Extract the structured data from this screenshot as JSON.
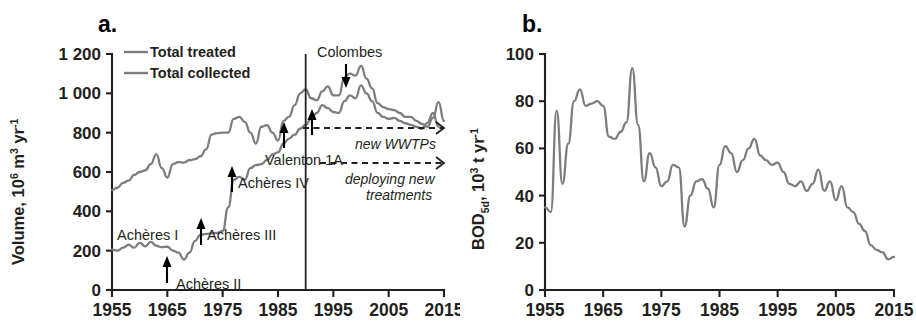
{
  "figure": {
    "background": "#ffffff",
    "line_color": "#7d7d7d",
    "axis_color": "#231f20"
  },
  "panels": {
    "a": {
      "letter": "a.",
      "ylabel_main": "Volume, 10",
      "ylabel_sup1": "6",
      "ylabel_mid": " m",
      "ylabel_sup2": "3",
      "ylabel_tail": " yr",
      "ylabel_sup3": "-1",
      "legend": [
        {
          "label": "Total treated",
          "color": "#7d7d7d"
        },
        {
          "label": "Total collected",
          "color": "#7d7d7d"
        }
      ],
      "annotations": [
        {
          "name": "acheres-1",
          "text": "Achères I"
        },
        {
          "name": "acheres-2",
          "text": "Achères II"
        },
        {
          "name": "acheres-3",
          "text": "Achères III"
        },
        {
          "name": "acheres-4",
          "text": "Achères IV"
        },
        {
          "name": "valenton-1a",
          "text": "Valenton  1A"
        },
        {
          "name": "colombes",
          "text": "Colombes"
        }
      ],
      "italic_notes": [
        {
          "name": "new-wwtps",
          "text": "new WWTPs"
        },
        {
          "name": "deploying-line1",
          "text": "deploying new"
        },
        {
          "name": "deploying-line2",
          "text": "treatments"
        }
      ]
    },
    "b": {
      "letter": "b.",
      "ylabel_main": "BOD",
      "ylabel_sub": "5d",
      "ylabel_mid": ", 10",
      "ylabel_sup1": "3",
      "ylabel_tail": " t yr",
      "ylabel_sup2": "-1"
    }
  },
  "chart_data": [
    {
      "id": "panel-a",
      "type": "line",
      "title": "a.",
      "xlabel": "",
      "ylabel": "Volume, 10^6 m^3 yr^-1",
      "xlim": [
        1955,
        2015
      ],
      "ylim": [
        0,
        1200
      ],
      "xticks": [
        1955,
        1965,
        1975,
        1985,
        1995,
        2005,
        2015
      ],
      "yticks": [
        0,
        200,
        400,
        600,
        800,
        1000,
        1200
      ],
      "grid": false,
      "legend_position": "top-left",
      "vertical_marker": {
        "x": 1990,
        "label": ""
      },
      "series": [
        {
          "name": "Total collected",
          "color": "#7d7d7d",
          "x": [
            1955,
            1956,
            1957,
            1958,
            1959,
            1960,
            1961,
            1962,
            1963,
            1964,
            1965,
            1966,
            1967,
            1968,
            1969,
            1970,
            1971,
            1972,
            1973,
            1974,
            1975,
            1976,
            1977,
            1978,
            1979,
            1980,
            1981,
            1982,
            1983,
            1984,
            1985,
            1986,
            1987,
            1988,
            1989,
            1990,
            1991,
            1992,
            1993,
            1994,
            1995,
            1996,
            1997,
            1998,
            1999,
            2000,
            2001,
            2002,
            2003,
            2004,
            2005,
            2006,
            2007,
            2008,
            2009,
            2010,
            2011,
            2012,
            2013,
            2014,
            2015
          ],
          "values": [
            508,
            520,
            545,
            556,
            585,
            600,
            608,
            640,
            690,
            620,
            572,
            640,
            650,
            648,
            660,
            665,
            680,
            715,
            790,
            798,
            800,
            800,
            870,
            880,
            855,
            800,
            745,
            830,
            838,
            800,
            760,
            860,
            880,
            940,
            1000,
            1020,
            975,
            965,
            1010,
            1035,
            990,
            990,
            1080,
            1100,
            1090,
            1140,
            1075,
            1025,
            950,
            930,
            920,
            915,
            900,
            880,
            880,
            860,
            845,
            830,
            875,
            955,
            860
          ]
        },
        {
          "name": "Total treated",
          "color": "#7d7d7d",
          "x": [
            1955,
            1956,
            1957,
            1958,
            1959,
            1960,
            1961,
            1962,
            1963,
            1964,
            1965,
            1966,
            1967,
            1968,
            1969,
            1970,
            1971,
            1972,
            1973,
            1974,
            1975,
            1976,
            1977,
            1978,
            1979,
            1980,
            1981,
            1982,
            1983,
            1984,
            1985,
            1986,
            1987,
            1988,
            1989,
            1990,
            1991,
            1992,
            1993,
            1994,
            1995,
            1996,
            1997,
            1998,
            1999,
            2000,
            2001,
            2002,
            2003,
            2004,
            2005,
            2006,
            2007,
            2008,
            2009,
            2010,
            2011,
            2012,
            2013,
            2014,
            2015
          ],
          "values": [
            205,
            200,
            215,
            230,
            215,
            240,
            222,
            245,
            225,
            218,
            220,
            200,
            190,
            155,
            190,
            250,
            280,
            285,
            288,
            290,
            300,
            420,
            560,
            575,
            560,
            620,
            635,
            640,
            660,
            690,
            700,
            745,
            770,
            790,
            820,
            840,
            870,
            900,
            940,
            925,
            905,
            900,
            960,
            990,
            975,
            1040,
            1000,
            960,
            900,
            880,
            870,
            875,
            860,
            848,
            840,
            830,
            820,
            850,
            900,
            830
          ]
        }
      ],
      "event_markers": [
        {
          "label": "Achères I",
          "x": 1958
        },
        {
          "label": "Achères II",
          "x": 1967
        },
        {
          "label": "Achères III",
          "x": 1972
        },
        {
          "label": "Achères IV",
          "x": 1978
        },
        {
          "label": "Valenton  1A",
          "x": 1987
        },
        {
          "label": "Colombes",
          "x": 1997
        }
      ],
      "trend_arrows": [
        {
          "label": "new WWTPs",
          "y": 805,
          "x_start": 1990,
          "x_end": 2015
        },
        {
          "label": "deploying new treatments",
          "y": 630,
          "x_start": 1990,
          "x_end": 2015
        }
      ]
    },
    {
      "id": "panel-b",
      "type": "line",
      "title": "b.",
      "xlabel": "",
      "ylabel": "BOD_5d, 10^3 t yr^-1",
      "xlim": [
        1955,
        2015
      ],
      "ylim": [
        0,
        100
      ],
      "xticks": [
        1955,
        1965,
        1975,
        1985,
        1995,
        2005,
        2015
      ],
      "yticks": [
        0,
        20,
        40,
        60,
        80,
        100
      ],
      "grid": false,
      "legend_position": "none",
      "series": [
        {
          "name": "BOD5d load",
          "color": "#7d7d7d",
          "x": [
            1955,
            1956,
            1957,
            1958,
            1959,
            1960,
            1961,
            1962,
            1963,
            1964,
            1965,
            1966,
            1967,
            1968,
            1969,
            1970,
            1971,
            1972,
            1973,
            1974,
            1975,
            1976,
            1977,
            1978,
            1979,
            1980,
            1981,
            1982,
            1983,
            1984,
            1985,
            1986,
            1987,
            1988,
            1989,
            1990,
            1991,
            1992,
            1993,
            1994,
            1995,
            1996,
            1997,
            1998,
            1999,
            2000,
            2001,
            2002,
            2003,
            2004,
            2005,
            2006,
            2007,
            2008,
            2009,
            2010,
            2011,
            2012,
            2013,
            2014,
            2015
          ],
          "values": [
            35,
            33,
            76,
            45,
            62,
            80,
            85,
            78,
            79,
            80,
            78,
            65,
            64,
            67,
            71,
            94,
            70,
            46,
            58,
            52,
            44,
            46,
            53,
            52,
            27,
            40,
            46,
            47,
            43,
            35,
            53,
            61,
            58,
            50,
            55,
            60,
            64,
            57,
            55,
            53,
            54,
            50,
            45,
            44,
            46,
            42,
            45,
            51,
            42,
            46,
            38,
            44,
            35,
            33,
            28,
            25,
            19,
            17,
            16,
            13,
            14,
            16,
            15,
            13,
            13,
            9
          ]
        }
      ]
    }
  ]
}
